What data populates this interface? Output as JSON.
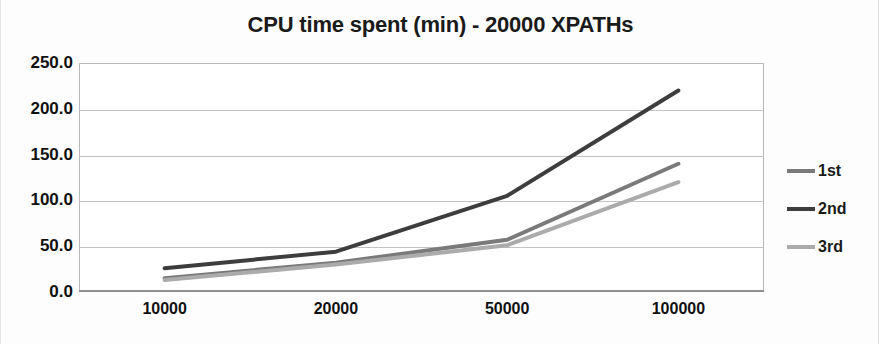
{
  "chart_data": {
    "type": "line",
    "title": "CPU time spent (min) - 20000 XPATHs",
    "xlabel": "",
    "ylabel": "",
    "categories": [
      "10000",
      "20000",
      "50000",
      "100000"
    ],
    "series": [
      {
        "name": "1st",
        "values": [
          15,
          32,
          57,
          140
        ],
        "color": "#7a7a7a"
      },
      {
        "name": "2nd",
        "values": [
          26,
          44,
          105,
          220
        ],
        "color": "#3d3d3d"
      },
      {
        "name": "3rd",
        "values": [
          13,
          30,
          51,
          120
        ],
        "color": "#ababab"
      }
    ],
    "ylim": [
      0,
      250
    ],
    "ytick_labels": [
      "250.0",
      "200.0",
      "150.0",
      "100.0",
      "50.0",
      "0.0"
    ],
    "ytick_values": [
      250,
      200,
      150,
      100,
      50,
      0
    ],
    "grid": true,
    "legend_position": "right",
    "legend_entries": [
      "1st",
      "2nd",
      "3rd"
    ],
    "colors": {
      "series_1st": "#7a7a7a",
      "series_2nd": "#3d3d3d",
      "series_3rd": "#ababab",
      "gridline": "#c3c3c3",
      "axis": "#8f8f8f",
      "text": "#111111",
      "background": "#ffffff"
    }
  }
}
